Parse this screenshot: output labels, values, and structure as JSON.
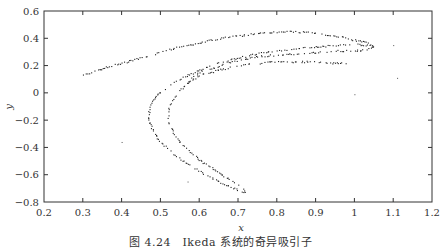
{
  "chart_data": {
    "type": "scatter",
    "title": "",
    "caption": "图 4.24　Ikeda 系统的奇异吸引子",
    "xlabel": "x",
    "ylabel": "y",
    "xlim": [
      0.2,
      1.2
    ],
    "ylim": [
      -0.8,
      0.6
    ],
    "xticks": [
      0.2,
      0.3,
      0.4,
      0.5,
      0.6,
      0.7,
      0.8,
      0.9,
      1.0,
      1.1,
      1.2
    ],
    "xtick_labels": [
      "0.2",
      "0.3",
      "0.4",
      "0.5",
      "0.6",
      "0.7",
      "0.8",
      "0.9",
      "1",
      "1.1",
      "1.2"
    ],
    "yticks": [
      0.6,
      0.4,
      0.2,
      0,
      -0.2,
      -0.4,
      -0.6,
      -0.8
    ],
    "ytick_labels": [
      "0.6",
      "0.4",
      "0.2",
      "0",
      "−0.2",
      "−0.4",
      "−0.6",
      "−0.8"
    ],
    "grid": false,
    "legend": null,
    "marker_color": "#222222",
    "series": [
      {
        "name": "outer-arc (upper)",
        "points": [
          [
            0.3,
            0.13
          ],
          [
            0.33,
            0.16
          ],
          [
            0.36,
            0.19
          ],
          [
            0.4,
            0.22
          ],
          [
            0.45,
            0.26
          ],
          [
            0.5,
            0.3
          ],
          [
            0.55,
            0.34
          ],
          [
            0.6,
            0.37
          ],
          [
            0.65,
            0.4
          ],
          [
            0.7,
            0.42
          ],
          [
            0.75,
            0.44
          ],
          [
            0.8,
            0.45
          ],
          [
            0.85,
            0.45
          ],
          [
            0.9,
            0.44
          ],
          [
            0.95,
            0.42
          ],
          [
            1.0,
            0.39
          ],
          [
            1.03,
            0.37
          ],
          [
            1.05,
            0.35
          ]
        ]
      },
      {
        "name": "inner-arc (upper, double strand)",
        "points": [
          [
            0.5,
            0.01
          ],
          [
            0.53,
            0.07
          ],
          [
            0.56,
            0.12
          ],
          [
            0.6,
            0.17
          ],
          [
            0.65,
            0.22
          ],
          [
            0.7,
            0.26
          ],
          [
            0.75,
            0.29
          ],
          [
            0.8,
            0.31
          ],
          [
            0.85,
            0.33
          ],
          [
            0.9,
            0.34
          ],
          [
            0.95,
            0.35
          ],
          [
            1.0,
            0.36
          ],
          [
            1.04,
            0.35
          ],
          [
            1.05,
            0.34
          ],
          [
            1.03,
            0.32
          ],
          [
            1.0,
            0.31
          ],
          [
            0.95,
            0.31
          ],
          [
            0.9,
            0.3
          ],
          [
            0.85,
            0.29
          ],
          [
            0.8,
            0.28
          ],
          [
            0.75,
            0.27
          ],
          [
            0.7,
            0.24
          ],
          [
            0.65,
            0.2
          ],
          [
            0.6,
            0.15
          ],
          [
            0.57,
            0.1
          ]
        ]
      },
      {
        "name": "lower-inner arc",
        "points": [
          [
            0.57,
            0.08
          ],
          [
            0.6,
            0.13
          ],
          [
            0.65,
            0.17
          ],
          [
            0.7,
            0.2
          ],
          [
            0.75,
            0.22
          ],
          [
            0.8,
            0.23
          ],
          [
            0.85,
            0.23
          ],
          [
            0.9,
            0.23
          ],
          [
            0.95,
            0.22
          ],
          [
            0.98,
            0.22
          ]
        ]
      },
      {
        "name": "left horseshoe (outer)",
        "points": [
          [
            0.5,
            0.01
          ],
          [
            0.48,
            -0.05
          ],
          [
            0.47,
            -0.12
          ],
          [
            0.47,
            -0.2
          ],
          [
            0.48,
            -0.28
          ],
          [
            0.5,
            -0.36
          ],
          [
            0.53,
            -0.44
          ],
          [
            0.57,
            -0.52
          ],
          [
            0.61,
            -0.59
          ],
          [
            0.65,
            -0.65
          ],
          [
            0.69,
            -0.7
          ],
          [
            0.72,
            -0.73
          ]
        ]
      },
      {
        "name": "left horseshoe (inner)",
        "points": [
          [
            0.57,
            0.08
          ],
          [
            0.55,
            0.02
          ],
          [
            0.53,
            -0.05
          ],
          [
            0.52,
            -0.12
          ],
          [
            0.52,
            -0.2
          ],
          [
            0.53,
            -0.28
          ],
          [
            0.55,
            -0.36
          ],
          [
            0.58,
            -0.44
          ],
          [
            0.61,
            -0.51
          ],
          [
            0.65,
            -0.58
          ],
          [
            0.68,
            -0.64
          ],
          [
            0.71,
            -0.69
          ],
          [
            0.72,
            -0.72
          ]
        ]
      },
      {
        "name": "stray points",
        "points": [
          [
            0.4,
            -0.36
          ],
          [
            1.0,
            -0.01
          ],
          [
            1.11,
            0.11
          ],
          [
            1.1,
            0.35
          ],
          [
            0.57,
            -0.65
          ]
        ]
      }
    ]
  }
}
